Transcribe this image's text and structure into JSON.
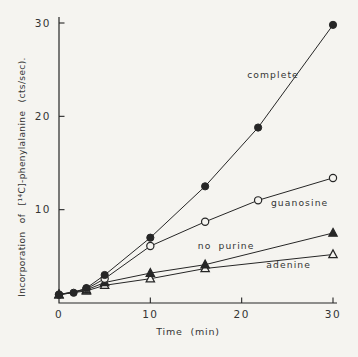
{
  "colors": {
    "background": "#f5f4f0",
    "ink": "#262626",
    "text": "#343434"
  },
  "chart_data": {
    "type": "line",
    "title": "",
    "xlabel": "Time (min)",
    "ylabel": "Incorporation of [¹⁴C]-phenylalanine (cts/sec).",
    "xlim": [
      0,
      30
    ],
    "ylim": [
      0,
      30
    ],
    "grid": false,
    "legend": "inline-curve-labels",
    "xticks": [
      {
        "value": 0,
        "label": "0"
      },
      {
        "value": 10,
        "label": "10"
      },
      {
        "value": 20,
        "label": "20"
      },
      {
        "value": 30,
        "label": "30"
      }
    ],
    "yticks": [
      {
        "value": 10,
        "label": "10"
      },
      {
        "value": 20,
        "label": "20"
      },
      {
        "value": 30,
        "label": "30"
      }
    ],
    "series": [
      {
        "name": "complete",
        "label": "complete",
        "marker": "filled-circle",
        "label_anchor": {
          "t": 20.6,
          "v": 24.1
        },
        "points": [
          [
            0,
            0.9
          ],
          [
            1.6,
            1.1
          ],
          [
            3,
            1.6
          ],
          [
            5,
            3.0
          ],
          [
            10,
            7.0
          ],
          [
            16,
            12.5
          ],
          [
            21.8,
            18.8
          ],
          [
            30,
            29.8
          ]
        ]
      },
      {
        "name": "guanosine",
        "label": "guanosine",
        "marker": "open-circle",
        "label_anchor": {
          "t": 23.2,
          "v": 10.4
        },
        "points": [
          [
            0,
            0.9
          ],
          [
            3,
            1.5
          ],
          [
            5,
            2.6
          ],
          [
            10,
            6.1
          ],
          [
            16,
            8.7
          ],
          [
            21.8,
            11.0
          ],
          [
            30,
            13.4
          ]
        ]
      },
      {
        "name": "no-purine",
        "label": "no purine",
        "marker": "filled-triangle",
        "label_anchor": {
          "t": 15.2,
          "v": 5.8
        },
        "points": [
          [
            0,
            0.9
          ],
          [
            3,
            1.4
          ],
          [
            5,
            2.2
          ],
          [
            10,
            3.2
          ],
          [
            16,
            4.1
          ],
          [
            30,
            7.5
          ]
        ]
      },
      {
        "name": "adenine",
        "label": "adenine",
        "marker": "open-triangle",
        "label_anchor": {
          "t": 22.7,
          "v": 3.75
        },
        "points": [
          [
            0,
            0.9
          ],
          [
            3,
            1.3
          ],
          [
            5,
            1.9
          ],
          [
            10,
            2.6
          ],
          [
            16,
            3.7
          ],
          [
            30,
            5.2
          ]
        ]
      }
    ]
  }
}
